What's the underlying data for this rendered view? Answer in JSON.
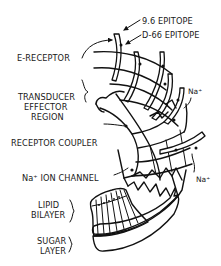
{
  "figure": {
    "labels": {
      "epitope_96": "9.6 EPITOPE",
      "epitope_d66": "D-66 EPITOPE",
      "e_receptor": "E-RECEPTOR",
      "transducer_1": "TRANSDUCER",
      "transducer_2": "EFFECTOR",
      "transducer_3": "REGION",
      "receptor_coupler": "RECEPTOR COUPLER",
      "na_ion_channel": "Na⁺ ION CHANNEL",
      "na_top": "Na⁺",
      "na_bottom": "Na⁺",
      "lipid_1": "LIPID",
      "lipid_2": "BILAYER",
      "sugar_1": "SUGAR",
      "sugar_2": "LAYER"
    }
  }
}
